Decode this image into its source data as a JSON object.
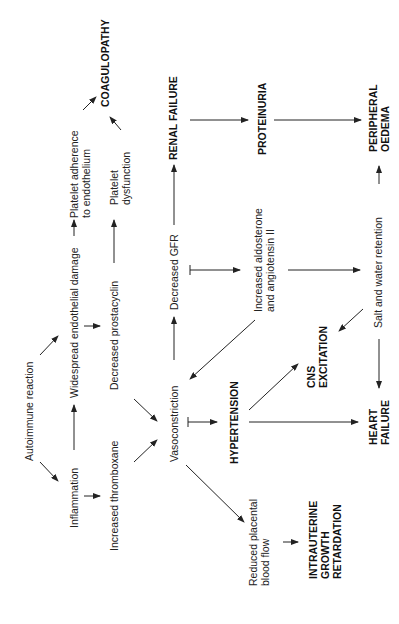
{
  "diagram": {
    "orientation": "rotated-90-ccw",
    "nodes": {
      "autoimmune": "Autoimmune reaction",
      "inflammation": "Inflammation",
      "endothelial": "Widespread endothelial damage",
      "thromboxane": "Increased thromboxane",
      "prostacyclin": "Decreased prostacyclin",
      "adherence_1": "Platelet adherence",
      "adherence_2": "to endothelium",
      "dysfunction_1": "Platelet",
      "dysfunction_2": "dysfunction",
      "coagulopathy": "COAGULOPATHY",
      "vasoconstriction": "Vasoconstriction",
      "gfr": "Decreased GFR",
      "renal": "RENAL FAILURE",
      "proteinuria": "PROTEINURIA",
      "peripheral_1": "PERIPHERAL",
      "peripheral_2": "OEDEMA",
      "aldosterone_1": "Increased aldosterone",
      "aldosterone_2": "and angiotensin II",
      "salt": "Salt and water retention",
      "cns_1": "CNS",
      "cns_2": "EXCITATION",
      "hypertension": "HYPERTENSION",
      "heart_1": "HEART",
      "heart_2": "FAILURE",
      "placental_1": "Reduced placental",
      "placental_2": "blood flow",
      "iugr_1": "INTRAUTERINE",
      "iugr_2": "GROWTH",
      "iugr_3": "RETARDATION"
    },
    "edges": [
      [
        "Autoimmune reaction",
        "Inflammation"
      ],
      [
        "Autoimmune reaction",
        "Widespread endothelial damage"
      ],
      [
        "Inflammation",
        "Widespread endothelial damage"
      ],
      [
        "Inflammation",
        "Increased thromboxane"
      ],
      [
        "Widespread endothelial damage",
        "Decreased prostacyclin"
      ],
      [
        "Widespread endothelial damage",
        "Platelet adherence to endothelium"
      ],
      [
        "Decreased prostacyclin",
        "Platelet dysfunction"
      ],
      [
        "Decreased prostacyclin",
        "Vasoconstriction"
      ],
      [
        "Increased thromboxane",
        "Vasoconstriction"
      ],
      [
        "Platelet adherence to endothelium",
        "COAGULOPATHY"
      ],
      [
        "Platelet dysfunction",
        "COAGULOPATHY"
      ],
      [
        "Vasoconstriction",
        "Decreased GFR"
      ],
      [
        "Decreased GFR",
        "RENAL FAILURE"
      ],
      [
        "Decreased GFR",
        "Increased aldosterone and angiotensin II"
      ],
      [
        "RENAL FAILURE",
        "PROTEINURIA"
      ],
      [
        "PROTEINURIA",
        "PERIPHERAL OEDEMA"
      ],
      [
        "Increased aldosterone and angiotensin II",
        "Vasoconstriction"
      ],
      [
        "Increased aldosterone and angiotensin II",
        "Salt and water retention"
      ],
      [
        "Salt and water retention",
        "PERIPHERAL OEDEMA"
      ],
      [
        "Salt and water retention",
        "CNS EXCITATION"
      ],
      [
        "Salt and water retention",
        "HEART FAILURE"
      ],
      [
        "Vasoconstriction",
        "HYPERTENSION"
      ],
      [
        "HYPERTENSION",
        "CNS EXCITATION"
      ],
      [
        "HYPERTENSION",
        "HEART FAILURE"
      ],
      [
        "Vasoconstriction",
        "Reduced placental blood flow"
      ],
      [
        "Reduced placental blood flow",
        "INTRAUTERINE GROWTH RETARDATION"
      ]
    ]
  }
}
